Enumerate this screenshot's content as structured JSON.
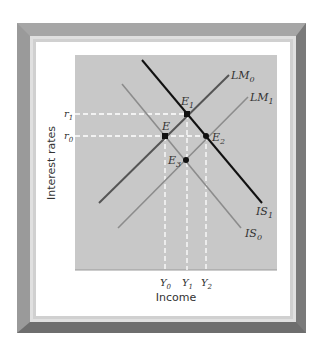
{
  "diagram": {
    "axes": {
      "xlabel": "Income",
      "ylabel": "Interest rates"
    },
    "y_ticks": [
      {
        "id": "r1",
        "base": "r",
        "sub": "1"
      },
      {
        "id": "r0",
        "base": "r",
        "sub": "0"
      }
    ],
    "x_ticks": [
      {
        "id": "Y0",
        "base": "Y",
        "sub": "0"
      },
      {
        "id": "Y1",
        "base": "Y",
        "sub": "1"
      },
      {
        "id": "Y2",
        "base": "Y",
        "sub": "2"
      }
    ],
    "curves": [
      {
        "id": "LM0",
        "base": "LM",
        "sub": "0",
        "color": "#555555"
      },
      {
        "id": "LM1",
        "base": "LM",
        "sub": "1",
        "color": "#8c8c8c"
      },
      {
        "id": "IS0",
        "base": "IS",
        "sub": "0",
        "color": "#8c8c8c"
      },
      {
        "id": "IS1",
        "base": "IS",
        "sub": "1",
        "color": "#111111"
      }
    ],
    "points": [
      {
        "id": "E",
        "base": "E",
        "sub": ""
      },
      {
        "id": "E1",
        "base": "E",
        "sub": "1"
      },
      {
        "id": "E2",
        "base": "E",
        "sub": "2"
      },
      {
        "id": "E3",
        "base": "E",
        "sub": "3"
      }
    ],
    "colors": {
      "plot_bg": "#c8c8c8",
      "guide": "#ffffff",
      "point": "#111111",
      "frame": "#8a8a8a"
    }
  }
}
